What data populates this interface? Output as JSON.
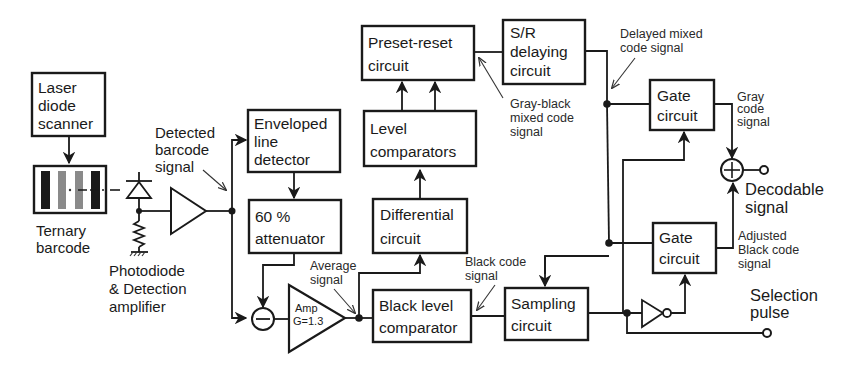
{
  "diagram": {
    "title": "",
    "blocks": {
      "laser_scanner": [
        "Laser",
        "diode",
        "scanner"
      ],
      "enveloped_detector": [
        "Enveloped",
        "line",
        "detector"
      ],
      "attenuator": [
        "60 %",
        "attenuator"
      ],
      "preset_reset": [
        "Preset-reset",
        "circuit"
      ],
      "sr_delay": [
        "S/R",
        "delaying",
        "circuit"
      ],
      "level_comparators": [
        "Level",
        "comparators"
      ],
      "differential": [
        "Differential",
        "circuit"
      ],
      "black_level": [
        "Black level",
        "comparator"
      ],
      "sampling": [
        "Sampling",
        "circuit"
      ],
      "gate_top": [
        "Gate",
        "circuit"
      ],
      "gate_bottom": [
        "Gate",
        "circuit"
      ],
      "amp": [
        "Amp",
        "G=1.3"
      ]
    },
    "labels": {
      "ternary_barcode": [
        "Ternary",
        "barcode"
      ],
      "photodiode": [
        "Photodiode",
        "& Detection",
        "amplifier"
      ],
      "detected_signal": [
        "Detected",
        "barcode",
        "signal"
      ],
      "average_signal": [
        "Average",
        "signal"
      ],
      "black_code_signal": [
        "Black code",
        "signal"
      ],
      "gray_black_mixed": [
        "Gray-black",
        "mixed code",
        "signal"
      ],
      "delayed_mixed": [
        "Delayed mixed",
        "code signal"
      ],
      "gray_code": [
        "Gray",
        "code",
        "signal"
      ],
      "decodable": [
        "Decodable",
        "signal"
      ],
      "adjusted_black": [
        "Adjusted",
        "Black code",
        "signal"
      ],
      "selection_pulse": [
        "Selection",
        "pulse"
      ]
    },
    "symbols": {
      "subtractor": "minus-circle",
      "adder": "plus-circle",
      "inverter": "not-gate",
      "photodiode": "diode",
      "resistor": "resistor-to-ground"
    },
    "colors": {
      "ink": "#1a1a1a",
      "bar_black": "#1a1a1a",
      "bar_gray": "#8a8a8a",
      "background": "#ffffff"
    }
  }
}
